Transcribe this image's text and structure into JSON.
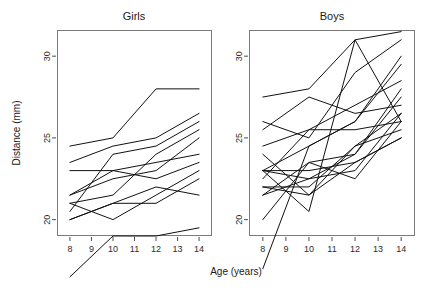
{
  "chart_data": {
    "type": "line",
    "title": "",
    "xlabel": "Age (years)",
    "ylabel": "Distance (mm)",
    "xlim": [
      7.4,
      14.6
    ],
    "ylim": [
      19.0,
      31.6
    ],
    "xticks": [
      8,
      9,
      10,
      11,
      12,
      13,
      14
    ],
    "xtick_labels": [
      "8",
      "9",
      "10",
      "11",
      "12",
      "13",
      "14"
    ],
    "yticks": [
      20,
      25,
      30
    ],
    "ytick_labels": [
      "20",
      "25",
      "30"
    ],
    "grid": false,
    "legend": "none",
    "line_color": "#111111",
    "frame_color": "#7a7a7a",
    "x": [
      8,
      10,
      12,
      14
    ],
    "panels": [
      {
        "name": "Girls",
        "label": "Girls",
        "series": [
          {
            "name": "F01",
            "values": [
              21.0,
              20.0,
              21.5,
              23.0
            ]
          },
          {
            "name": "F02",
            "values": [
              21.0,
              21.5,
              24.0,
              25.5
            ]
          },
          {
            "name": "F03",
            "values": [
              20.5,
              24.0,
              24.5,
              26.0
            ]
          },
          {
            "name": "F04",
            "values": [
              23.5,
              24.5,
              25.0,
              26.5
            ]
          },
          {
            "name": "F05",
            "values": [
              21.5,
              23.0,
              22.5,
              23.5
            ]
          },
          {
            "name": "F06",
            "values": [
              20.0,
              21.0,
              21.0,
              22.5
            ]
          },
          {
            "name": "F07",
            "values": [
              21.5,
              22.5,
              23.0,
              25.0
            ]
          },
          {
            "name": "F08",
            "values": [
              23.0,
              23.0,
              23.5,
              24.0
            ]
          },
          {
            "name": "F09",
            "values": [
              20.0,
              21.0,
              22.0,
              21.5
            ]
          },
          {
            "name": "F10",
            "values": [
              16.5,
              19.0,
              19.0,
              19.5
            ]
          },
          {
            "name": "F11",
            "values": [
              24.5,
              25.0,
              28.0,
              28.0
            ]
          }
        ]
      },
      {
        "name": "Boys",
        "label": "Boys",
        "series": [
          {
            "name": "M01",
            "values": [
              26.0,
              25.0,
              29.0,
              31.0
            ]
          },
          {
            "name": "M02",
            "values": [
              21.5,
              22.5,
              23.0,
              26.5
            ]
          },
          {
            "name": "M03",
            "values": [
              23.0,
              22.5,
              24.0,
              27.5
            ]
          },
          {
            "name": "M04",
            "values": [
              25.5,
              27.5,
              26.5,
              27.0
            ]
          },
          {
            "name": "M05",
            "values": [
              20.0,
              23.5,
              22.5,
              26.0
            ]
          },
          {
            "name": "M06",
            "values": [
              24.5,
              25.5,
              27.0,
              28.5
            ]
          },
          {
            "name": "M07",
            "values": [
              22.0,
              22.0,
              24.5,
              26.5
            ]
          },
          {
            "name": "M08",
            "values": [
              24.0,
              21.5,
              24.5,
              25.5
            ]
          },
          {
            "name": "M09",
            "values": [
              23.0,
              20.5,
              31.0,
              26.0
            ]
          },
          {
            "name": "M10",
            "values": [
              27.5,
              28.0,
              31.0,
              31.5
            ]
          },
          {
            "name": "M11",
            "values": [
              23.0,
              23.0,
              23.5,
              25.0
            ]
          },
          {
            "name": "M12",
            "values": [
              21.5,
              23.5,
              24.0,
              28.0
            ]
          },
          {
            "name": "M13",
            "values": [
              17.0,
              24.5,
              26.0,
              29.5
            ]
          },
          {
            "name": "M14",
            "values": [
              22.5,
              25.5,
              25.5,
              26.0
            ]
          },
          {
            "name": "M15",
            "values": [
              23.0,
              24.5,
              26.0,
              30.0
            ]
          },
          {
            "name": "M16",
            "values": [
              22.0,
              21.5,
              23.5,
              25.0
            ]
          }
        ]
      }
    ]
  },
  "layout": {
    "panels": [
      {
        "key": "girls",
        "x": 57,
        "y": 30,
        "width": 155,
        "height": 206
      },
      {
        "key": "boys",
        "x": 249,
        "y": 30,
        "width": 166,
        "height": 206
      }
    ],
    "title_y": 20,
    "xlabel_pos": {
      "x": 236,
      "y": 275
    },
    "ylabel_pos": {
      "x": 20,
      "y": 133
    }
  }
}
